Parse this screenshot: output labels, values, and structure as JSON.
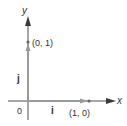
{
  "diagram": {
    "axes": {
      "x_label": "x",
      "y_label": "y",
      "origin_label": "0"
    },
    "vectors": [
      {
        "name": "i",
        "label": "i",
        "endpoint_label": "(1, 0)"
      },
      {
        "name": "j",
        "label": "j",
        "endpoint_label": "(0, 1)"
      }
    ],
    "colors": {
      "axis": "#8a8a8a",
      "vector": "#9a9a9a",
      "arrowhead": "#3a3a3a",
      "text": "#333333"
    }
  }
}
